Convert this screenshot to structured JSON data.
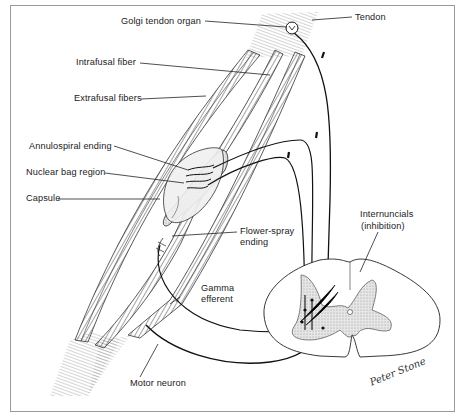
{
  "figure": {
    "labels": {
      "golgi_tendon_organ": "Golgi tendon organ",
      "tendon": "Tendon",
      "intrafusal_fiber": "Intrafusal fiber",
      "extrafusal_fibers": "Extrafusal fibers",
      "annulospiral_ending": "Annulospiral ending",
      "nuclear_bag_region": "Nuclear bag region",
      "capsule": "Capsule",
      "flower_spray_line1": "Flower-spray",
      "flower_spray_line2": "ending",
      "internuncials_line1": "Internuncials",
      "internuncials_line2": "(inhibition)",
      "gamma_line1": "Gamma",
      "gamma_line2": "efferent",
      "motor_neuron": "Motor neuron"
    },
    "signature": "Peter Stone",
    "colors": {
      "line": "#1a1a1a",
      "fiber": "#4a4a4a",
      "gray_matter": "#d8d8d8",
      "frame": "#9a9a9a",
      "background": "#ffffff"
    }
  }
}
